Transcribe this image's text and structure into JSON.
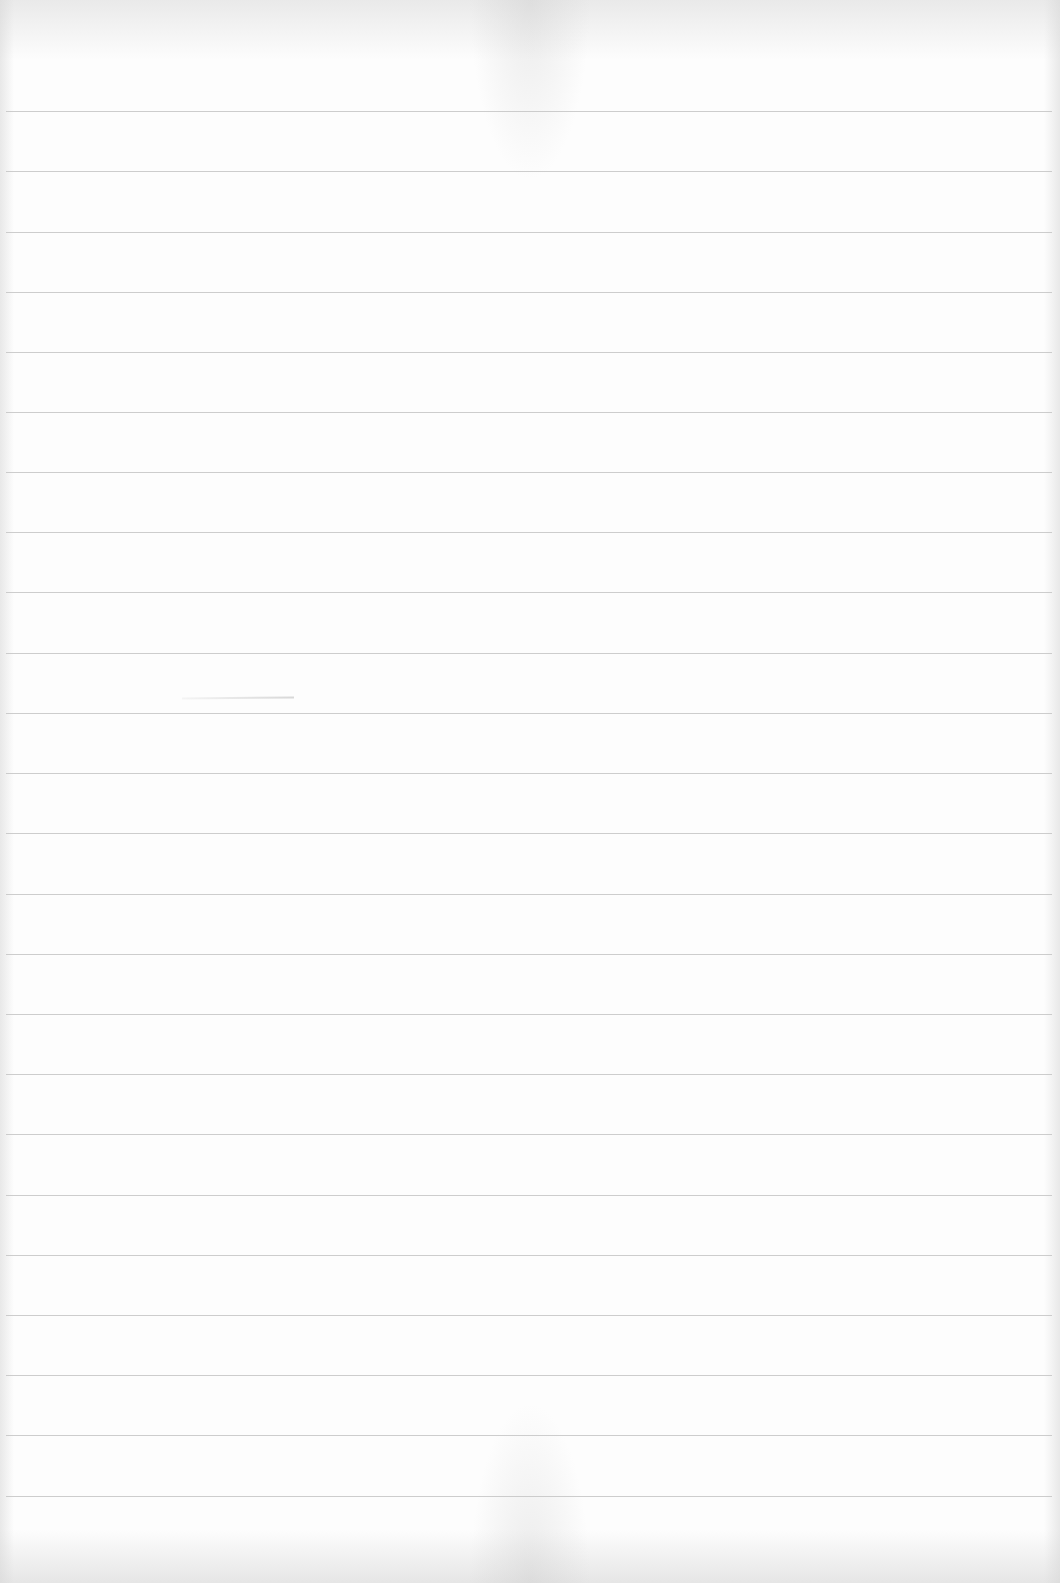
{
  "document": {
    "type": "lined paper",
    "content": "",
    "line_count": 24,
    "line_positions_px": [
      111,
      171,
      232,
      292,
      352,
      412,
      472,
      532,
      592,
      653,
      713,
      773,
      833,
      894,
      954,
      1014,
      1074,
      1134,
      1195,
      1255,
      1315,
      1375,
      1435,
      1496
    ],
    "colors": {
      "paper": "#fdfdfd",
      "rule_line": "#c4c4c4"
    }
  }
}
